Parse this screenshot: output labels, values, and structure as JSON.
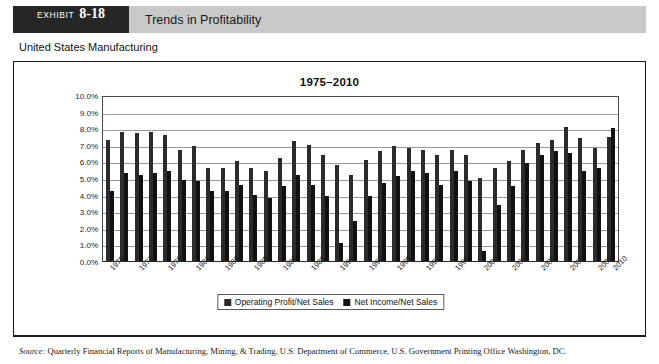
{
  "exhibit": {
    "label_word": "EXHIBIT",
    "number": "8-18",
    "title": "Trends in Profitability"
  },
  "subheader": {
    "text": "United States Manufacturing"
  },
  "source": {
    "prefix": "Source:",
    "text": " Quarterly Financial Reports of Manufacturing, Mining, & Trading, U.S. Department of Commerce, U.S. Government Printing Office Washington, DC."
  },
  "legend": {
    "position": "bottom",
    "items": [
      {
        "label": "Operating Profit/Net Sales",
        "color": "#2b2b2b"
      },
      {
        "label": "Net Income/Net Sales",
        "color": "#111111"
      }
    ]
  },
  "chart_data": {
    "type": "bar",
    "title": "1975–2010",
    "xlabel": "",
    "ylabel": "",
    "ylim": [
      0,
      10
    ],
    "yticks": [
      "0.0%",
      "1.0%",
      "2.0%",
      "3.0%",
      "4.0%",
      "5.0%",
      "6.0%",
      "7.0%",
      "8.0%",
      "9.0%",
      "10.0%"
    ],
    "ytick_values": [
      0,
      1,
      2,
      3,
      4,
      5,
      6,
      7,
      8,
      9,
      10
    ],
    "grid": true,
    "unit": "%",
    "categories": [
      "1975",
      "1976",
      "1977",
      "1978",
      "1979",
      "1980",
      "1981",
      "1982",
      "1983",
      "1984",
      "1985",
      "1986",
      "1987",
      "1988",
      "1989",
      "1990",
      "1991",
      "1992",
      "1993",
      "1994",
      "1995",
      "1996",
      "1997",
      "1998",
      "1999",
      "2000",
      "2001",
      "2002",
      "2003",
      "2004",
      "2005",
      "2006",
      "2007",
      "2008",
      "2009",
      "2010"
    ],
    "xtick_labels": [
      "1975",
      "1977",
      "1979",
      "1981",
      "1983",
      "1985",
      "1987",
      "1989",
      "1991",
      "1993",
      "1995",
      "1997",
      "1999",
      "2001",
      "2003",
      "2005",
      "2007",
      "2009",
      "2010"
    ],
    "series": [
      {
        "name": "Operating Profit/Net Sales",
        "color": "#2b2b2b",
        "values": [
          7.3,
          7.8,
          7.7,
          7.8,
          7.6,
          6.7,
          6.9,
          5.6,
          5.6,
          6.0,
          5.6,
          5.4,
          6.2,
          7.2,
          7.0,
          6.4,
          5.8,
          5.2,
          6.1,
          6.6,
          6.9,
          6.8,
          6.7,
          6.4,
          6.7,
          6.4,
          5.0,
          5.6,
          6.0,
          6.7,
          7.1,
          7.3,
          8.1,
          7.4,
          6.8,
          7.5
        ]
      },
      {
        "name": "Net Income/Net Sales",
        "color": "#111111",
        "values": [
          4.2,
          5.3,
          5.2,
          5.3,
          5.4,
          4.9,
          4.8,
          4.2,
          4.2,
          4.6,
          4.0,
          3.8,
          4.5,
          5.2,
          4.6,
          3.9,
          1.1,
          2.4,
          3.9,
          4.7,
          5.1,
          5.4,
          5.3,
          4.6,
          5.4,
          4.8,
          0.6,
          3.4,
          4.5,
          5.9,
          6.4,
          6.6,
          6.5,
          5.4,
          5.6,
          8.0
        ]
      }
    ]
  }
}
